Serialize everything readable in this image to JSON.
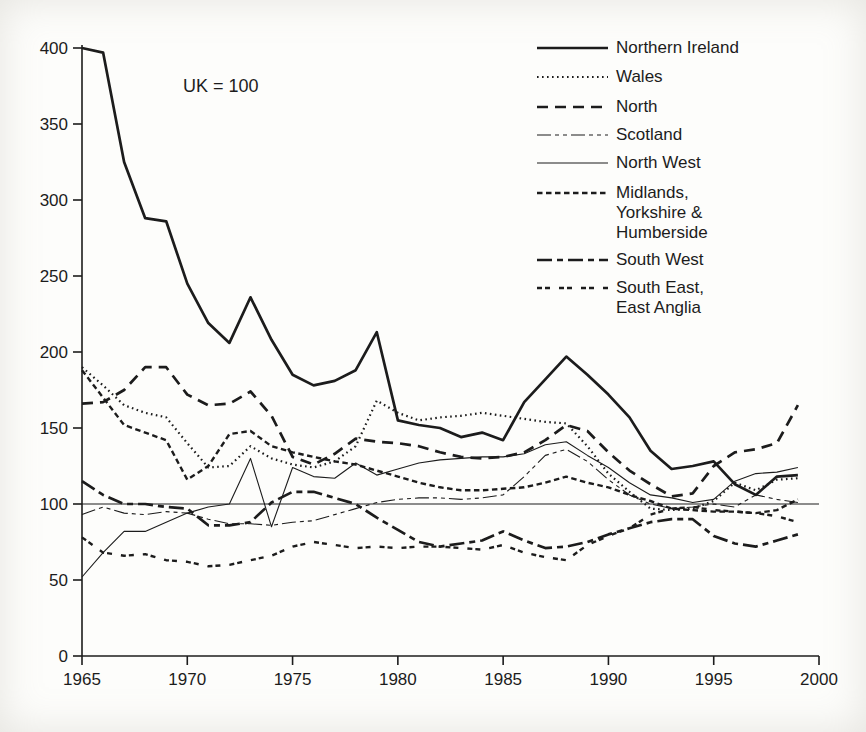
{
  "page": {
    "background": "#fdfdfb",
    "ink_color": "#1c1c1c"
  },
  "annotation": {
    "text": "UK = 100"
  },
  "chart_data": {
    "type": "line",
    "title": "",
    "xlabel": "",
    "ylabel": "",
    "note": "UK = 100",
    "xlim": [
      1965,
      2000
    ],
    "ylim": [
      0,
      400
    ],
    "xticks": [
      1965,
      1970,
      1975,
      1980,
      1985,
      1990,
      1995,
      2000
    ],
    "yticks": [
      0,
      50,
      100,
      150,
      200,
      250,
      300,
      350,
      400
    ],
    "reference_line": 100,
    "grid": false,
    "legend_position": "top-right",
    "years": [
      1965,
      1966,
      1967,
      1968,
      1969,
      1970,
      1971,
      1972,
      1973,
      1974,
      1975,
      1976,
      1977,
      1978,
      1979,
      1980,
      1981,
      1982,
      1983,
      1984,
      1985,
      1986,
      1987,
      1988,
      1989,
      1990,
      1991,
      1992,
      1993,
      1994,
      1995,
      1996,
      1997,
      1998,
      1999
    ],
    "series": [
      {
        "name": "Northern Ireland",
        "legend_lines": [
          "Northern Ireland"
        ],
        "values": [
          400,
          397,
          325,
          288,
          286,
          245,
          219,
          206,
          236,
          208,
          185,
          178,
          181,
          188,
          213,
          155,
          152,
          150,
          144,
          147,
          142,
          167,
          182,
          197,
          185,
          172,
          157,
          135,
          123,
          125,
          128,
          113,
          106,
          118,
          119
        ]
      },
      {
        "name": "Wales",
        "legend_lines": [
          "Wales"
        ],
        "values": [
          190,
          178,
          165,
          160,
          157,
          140,
          124,
          125,
          138,
          130,
          126,
          124,
          128,
          138,
          168,
          160,
          155,
          157,
          158,
          160,
          158,
          156,
          154,
          153,
          138,
          120,
          108,
          97,
          96,
          97,
          102,
          114,
          109,
          116,
          117
        ]
      },
      {
        "name": "North",
        "legend_lines": [
          "North"
        ],
        "values": [
          166,
          167,
          175,
          190,
          190,
          172,
          165,
          166,
          174,
          158,
          131,
          126,
          133,
          143,
          141,
          140,
          138,
          134,
          131,
          130,
          131,
          134,
          142,
          152,
          148,
          134,
          122,
          113,
          105,
          107,
          125,
          134,
          136,
          140,
          165
        ]
      },
      {
        "name": "Scotland",
        "legend_lines": [
          "Scotland"
        ],
        "values": [
          93,
          98,
          94,
          93,
          95,
          94,
          90,
          87,
          87,
          86,
          88,
          89,
          93,
          97,
          101,
          103,
          104,
          104,
          103,
          104,
          106,
          118,
          132,
          136,
          128,
          116,
          106,
          100,
          97,
          98,
          100,
          98,
          106,
          103,
          101
        ]
      },
      {
        "name": "North West",
        "legend_lines": [
          "North West"
        ],
        "values": [
          52,
          68,
          82,
          82,
          88,
          94,
          98,
          100,
          130,
          85,
          124,
          118,
          117,
          127,
          119,
          123,
          127,
          129,
          130,
          131,
          131,
          133,
          139,
          141,
          132,
          124,
          114,
          106,
          104,
          101,
          103,
          115,
          120,
          121,
          124
        ]
      },
      {
        "name": "Midlands, Yorkshire & Humberside",
        "legend_lines": [
          "Midlands,",
          "Yorkshire &",
          "Humberside"
        ],
        "values": [
          188,
          170,
          152,
          147,
          142,
          116,
          125,
          146,
          148,
          138,
          134,
          131,
          128,
          126,
          122,
          118,
          114,
          111,
          109,
          109,
          110,
          111,
          114,
          118,
          114,
          111,
          106,
          102,
          97,
          96,
          95,
          95,
          94,
          96,
          103
        ]
      },
      {
        "name": "South West",
        "legend_lines": [
          "South West"
        ],
        "values": [
          115,
          106,
          100,
          100,
          98,
          97,
          86,
          86,
          88,
          101,
          108,
          108,
          104,
          100,
          91,
          83,
          75,
          72,
          74,
          76,
          82,
          76,
          71,
          72,
          75,
          80,
          84,
          88,
          90,
          90,
          79,
          74,
          72,
          76,
          80
        ]
      },
      {
        "name": "South East, East Anglia",
        "legend_lines": [
          "South East,",
          "East Anglia"
        ],
        "values": [
          78,
          68,
          66,
          67,
          63,
          62,
          59,
          60,
          63,
          66,
          72,
          75,
          73,
          71,
          72,
          71,
          72,
          72,
          71,
          70,
          73,
          68,
          65,
          63,
          73,
          79,
          84,
          93,
          97,
          98,
          96,
          95,
          94,
          92,
          88
        ]
      }
    ]
  }
}
